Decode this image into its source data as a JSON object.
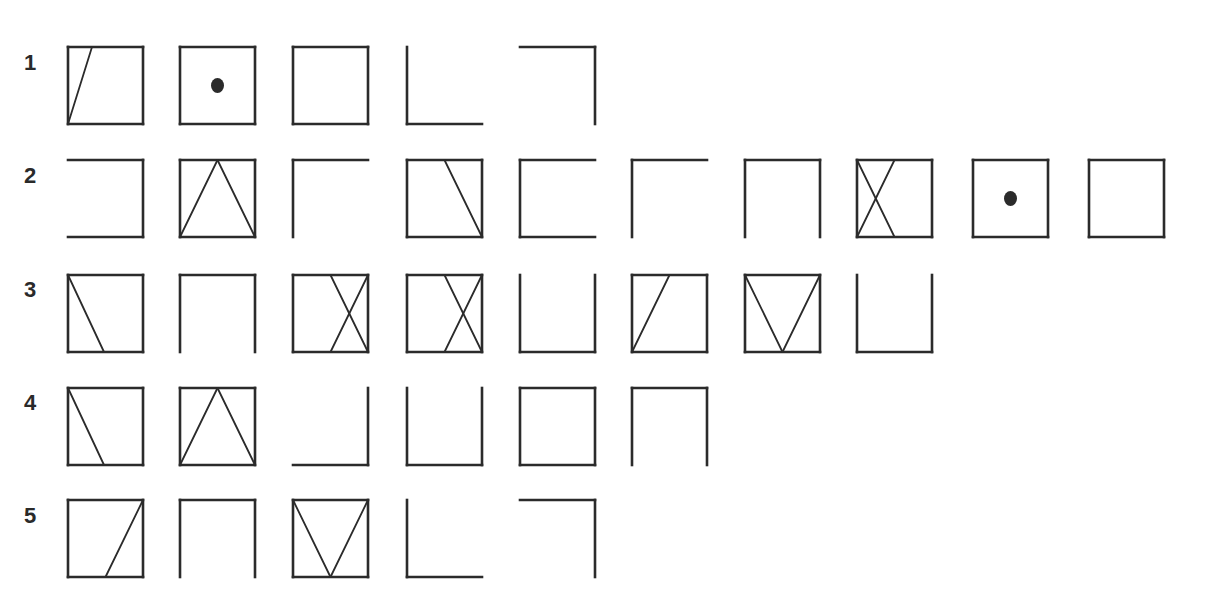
{
  "figure": {
    "rows": [
      {
        "label": "1",
        "symbols": [
          "box-slash-bl-to-t1",
          "box-dot",
          "box",
          "corner-L",
          "corner-top-right"
        ]
      },
      {
        "label": "2",
        "symbols": [
          "bracket-open-left",
          "box-triangle-up",
          "corner-top-left",
          "box-line-tmid-to-br",
          "bracket-open-right",
          "corner-top-left",
          "bracket-open-bottom",
          "box-x-left",
          "box-dot",
          "box"
        ]
      },
      {
        "label": "3",
        "symbols": [
          "box-line-tl-to-bmid",
          "bracket-open-bottom",
          "box-x-right",
          "box-x-right",
          "bracket-open-top",
          "box-line-bl-to-tmid",
          "box-v",
          "bracket-open-top"
        ]
      },
      {
        "label": "4",
        "symbols": [
          "box-line-tl-to-bmid",
          "box-triangle-up",
          "corner-bottom-right",
          "bracket-open-top",
          "box",
          "bracket-open-bottom"
        ]
      },
      {
        "label": "5",
        "symbols": [
          "box-line-bmid-to-tr",
          "bracket-open-bottom",
          "box-v",
          "corner-L",
          "corner-top-right"
        ]
      }
    ]
  }
}
